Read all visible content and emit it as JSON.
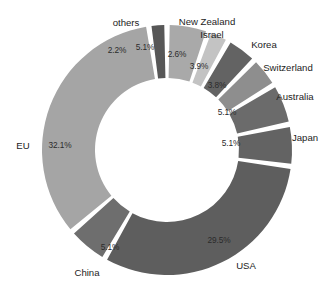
{
  "chart_data": {
    "type": "pie",
    "variant": "donut",
    "title": "",
    "subtitle": "",
    "xlabel": "",
    "ylabel": "",
    "legend_position": "none",
    "grid": false,
    "value_unit": "percent",
    "start_angle_deg": 0,
    "direction": "clockwise",
    "categories": [
      "New Zealand",
      "Israel",
      "Korea",
      "Switzerland",
      "Australia",
      "Japan",
      "USA",
      "China",
      "EU",
      "others"
    ],
    "values": [
      5.1,
      2.6,
      3.9,
      3.8,
      5.1,
      5.1,
      29.5,
      5.1,
      32.1,
      2.2
    ],
    "value_labels": [
      "5.1%",
      "2.6%",
      "3.9%",
      "3.8%",
      "5.1%",
      "5.1%",
      "29.5%",
      "5.1%",
      "32.1%",
      "2.2%"
    ],
    "slice_colors": [
      "#a9a9a9",
      "#c3c3c3",
      "#636363",
      "#8e8e8e",
      "#6b6b6b",
      "#636363",
      "#5e5e5e",
      "#6e6e6e",
      "#a5a5a5",
      "#575757"
    ],
    "slices": [
      {
        "name": "New Zealand",
        "value": 5.1,
        "label": "5.1%",
        "color": "#a9a9a9"
      },
      {
        "name": "Israel",
        "value": 2.6,
        "label": "2.6%",
        "color": "#c3c3c3"
      },
      {
        "name": "Korea",
        "value": 3.9,
        "label": "3.9%",
        "color": "#636363"
      },
      {
        "name": "Switzerland",
        "value": 3.8,
        "label": "3.8%",
        "color": "#8e8e8e"
      },
      {
        "name": "Australia",
        "value": 5.1,
        "label": "5.1%",
        "color": "#6b6b6b"
      },
      {
        "name": "Japan",
        "value": 5.1,
        "label": "5.1%",
        "color": "#636363"
      },
      {
        "name": "USA",
        "value": 29.5,
        "label": "29.5%",
        "color": "#5e5e5e"
      },
      {
        "name": "China",
        "value": 5.1,
        "label": "5.1%",
        "color": "#6e6e6e"
      },
      {
        "name": "EU",
        "value": 32.1,
        "label": "32.1%",
        "color": "#a5a5a5"
      },
      {
        "name": "others",
        "value": 2.2,
        "label": "2.2%",
        "color": "#575757"
      }
    ]
  },
  "category_labels": {
    "new_zealand": "New Zealand",
    "israel": "Israel",
    "korea": "Korea",
    "switzerland": "Switzerland",
    "australia": "Australia",
    "japan": "Japan",
    "usa": "USA",
    "china": "China",
    "eu": "EU",
    "others": "others"
  },
  "percent_labels": {
    "new_zealand": "5.1%",
    "israel": "2.6%",
    "korea": "3.9%",
    "switzerland": "3.8%",
    "australia": "5.1%",
    "japan": "5.1%",
    "usa": "29.5%",
    "china": "5.1%",
    "eu": "32.1%",
    "others": "2.2%"
  },
  "style": {
    "background": "#ffffff",
    "label_color": "#1c1c1c",
    "value_color": "#2b2b2b"
  }
}
